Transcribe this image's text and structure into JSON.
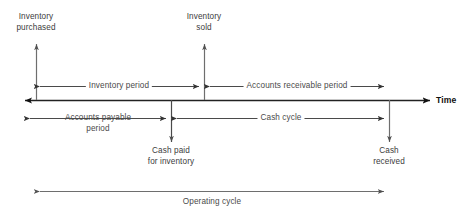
{
  "figure": {
    "axis_label": "Time",
    "colors": {
      "axis": "#222222",
      "arrow": "#3a3a3a",
      "light_arrow": "#6b6b6b",
      "text": "#4a4a4a",
      "background": "#ffffff"
    }
  },
  "events": [
    {
      "id": "inventory-purchased",
      "line1": "Inventory",
      "line2": "purchased",
      "x": 36,
      "position": "above"
    },
    {
      "id": "inventory-sold",
      "line1": "Inventory",
      "line2": "sold",
      "x": 204,
      "position": "above"
    },
    {
      "id": "cash-paid-for-inventory",
      "line1": "Cash paid",
      "line2": "for inventory",
      "x": 171,
      "position": "below"
    },
    {
      "id": "cash-received",
      "line1": "Cash",
      "line2": "received",
      "x": 389,
      "position": "below"
    }
  ],
  "periods": [
    {
      "id": "inventory-period",
      "label": "Inventory period",
      "from_x": 36,
      "to_x": 203,
      "y": 86,
      "label_x": 119
    },
    {
      "id": "accounts-receivable-period",
      "label": "Accounts receivable period",
      "from_x": 206,
      "to_x": 388,
      "y": 86,
      "label_x": 297
    },
    {
      "id": "accounts-payable-period",
      "label_line1": "Accounts payable",
      "label_line2": "period",
      "from_x": 26,
      "to_x": 170,
      "y": 118,
      "label_x": 98
    },
    {
      "id": "cash-cycle",
      "label": "Cash cycle",
      "from_x": 173,
      "to_x": 388,
      "y": 118,
      "label_x": 281
    },
    {
      "id": "operating-cycle",
      "label": "Operating cycle",
      "from_x": 36,
      "to_x": 388,
      "y": 191,
      "label_x": 212
    }
  ]
}
